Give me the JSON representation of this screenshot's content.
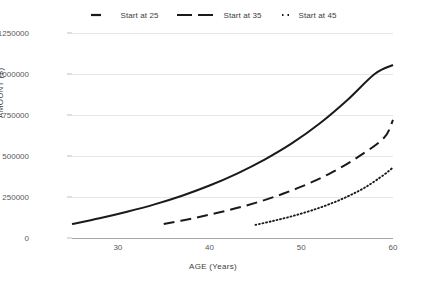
{
  "chart_data": {
    "type": "line",
    "title": "",
    "xlabel": "AGE (Years)",
    "ylabel": "AMOUNT ($)",
    "xlim": [
      25,
      60
    ],
    "ylim": [
      0,
      1250000
    ],
    "xticks": [
      30,
      40,
      50,
      60
    ],
    "yticks": [
      0,
      250000,
      500000,
      750000,
      1000000,
      1250000
    ],
    "ytick_labels": [
      "0",
      "250000",
      "500000",
      "750000",
      "1000000",
      "1250000"
    ],
    "grid": true,
    "legend_position": "top-center",
    "line_color": "#1a1a1a",
    "grid_color": "#e6e6e6",
    "axis_color": "#a6a6a6",
    "series": [
      {
        "name": "Start at 25",
        "style": "solid",
        "x": [
          25,
          28,
          31,
          34,
          37,
          40,
          43,
          46,
          49,
          52,
          55,
          58,
          60
        ],
        "values": [
          85000,
          120000,
          160000,
          205000,
          258000,
          320000,
          393000,
          478000,
          578000,
          698000,
          840000,
          1000000,
          1055000
        ]
      },
      {
        "name": "Start at 35",
        "style": "dashed",
        "x": [
          35,
          38,
          41,
          44,
          47,
          50,
          53,
          56,
          59,
          60
        ],
        "values": [
          85000,
          118000,
          155000,
          198000,
          250000,
          313000,
          390000,
          487000,
          610000,
          720000
        ]
      },
      {
        "name": "Start at 45",
        "style": "dotted",
        "x": [
          45,
          47,
          49,
          51,
          53,
          55,
          57,
          59,
          60
        ],
        "values": [
          80000,
          105000,
          133000,
          166000,
          205000,
          252000,
          310000,
          385000,
          430000
        ]
      }
    ]
  },
  "legend": {
    "items": [
      {
        "label": "Start at 25",
        "style": "solid"
      },
      {
        "label": "Start at 35",
        "style": "dashed"
      },
      {
        "label": "Start at 45",
        "style": "dotted"
      }
    ]
  }
}
